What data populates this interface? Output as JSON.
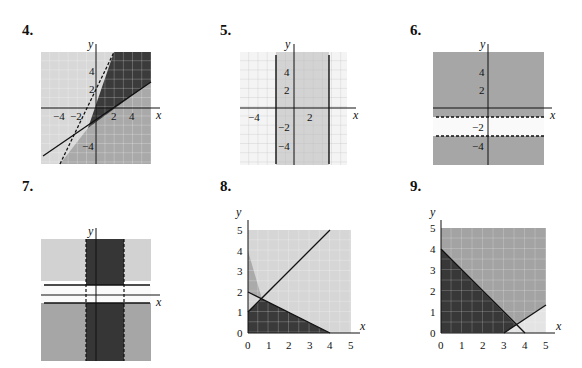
{
  "problems": [
    {
      "number": "4.",
      "axis_x": "x",
      "axis_y": "y",
      "x_ticks": [
        "−4",
        "−2",
        "2",
        "4"
      ],
      "y_ticks": [
        "4",
        "2",
        "−4"
      ]
    },
    {
      "number": "5.",
      "axis_x": "x",
      "axis_y": "y",
      "x_ticks": [
        "−4",
        "2"
      ],
      "y_ticks": [
        "4",
        "2",
        "−2",
        "−4"
      ]
    },
    {
      "number": "6.",
      "axis_x": "x",
      "axis_y": "y",
      "x_ticks": [],
      "y_ticks": [
        "4",
        "2",
        "−2",
        "−4"
      ]
    },
    {
      "number": "7.",
      "axis_x": "x",
      "axis_y": "y",
      "x_ticks": [],
      "y_ticks": [
        "1",
        "−2"
      ]
    },
    {
      "number": "8.",
      "axis_x": "x",
      "axis_y": "y",
      "x_ticks": [
        "0",
        "1",
        "2",
        "3",
        "4",
        "5"
      ],
      "y_ticks": [
        "0",
        "1",
        "2",
        "3",
        "4",
        "5"
      ]
    },
    {
      "number": "9.",
      "axis_x": "x",
      "axis_y": "y",
      "x_ticks": [
        "0",
        "1",
        "2",
        "3",
        "4",
        "5"
      ],
      "y_ticks": [
        "0",
        "1",
        "2",
        "3",
        "4",
        "5"
      ]
    }
  ],
  "colors": {
    "light": "#d6d6d6",
    "mid": "#a8a8a8",
    "dark": "#3a3a3a",
    "grid": "#ffffff"
  }
}
